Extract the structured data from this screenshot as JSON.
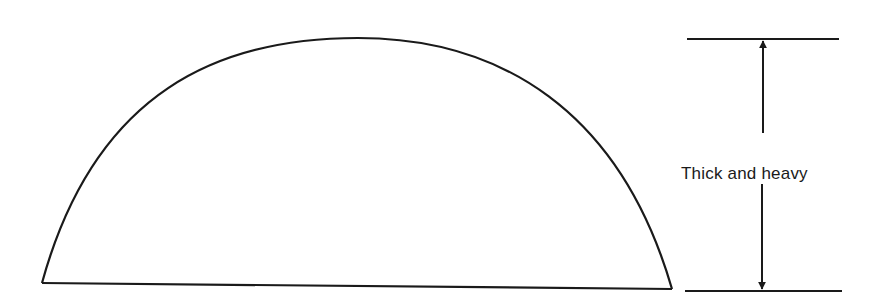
{
  "diagram": {
    "shape": "half-dome / semicircular profile",
    "dimension_label": "Thick and heavy",
    "stroke_color": "#1a1a1a",
    "background_color": "#ffffff"
  }
}
